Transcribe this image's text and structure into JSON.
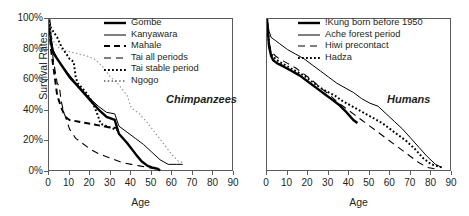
{
  "figure": {
    "axis_label_x": "Age",
    "axis_label_y": "Survival Rates",
    "panels": [
      {
        "id": "chimpanzees",
        "title": "Chimpanzees"
      },
      {
        "id": "humans",
        "title": "Humans"
      }
    ]
  },
  "chart_data": [
    {
      "type": "line",
      "title": "Chimpanzees",
      "xlabel": "Age",
      "ylabel": "Survival Rates",
      "xlim": [
        0,
        90
      ],
      "ylim": [
        0,
        100
      ],
      "xticks": [
        0,
        10,
        20,
        30,
        40,
        50,
        60,
        70,
        80,
        90
      ],
      "yticks": [
        0,
        20,
        40,
        60,
        80,
        100
      ],
      "ytick_labels": [
        "0%",
        "20%",
        "40%",
        "60%",
        "80%",
        "100%"
      ],
      "grid": false,
      "legend_position": "top-right",
      "series": [
        {
          "name": "Gombe",
          "style": "solid-thick",
          "color": "#000000",
          "x": [
            0,
            1,
            2,
            3,
            5,
            8,
            10,
            14,
            18,
            20,
            24,
            28,
            30,
            32,
            34,
            38,
            42,
            45,
            48,
            50,
            53,
            54
          ],
          "y": [
            100,
            84,
            78,
            76,
            72,
            66,
            62,
            56,
            50,
            47,
            41,
            36,
            35,
            34,
            25,
            19,
            12,
            7,
            4,
            3,
            2,
            1
          ]
        },
        {
          "name": "Kanyawara",
          "style": "solid-thin",
          "color": "#000000",
          "x": [
            0,
            1,
            2,
            4,
            6,
            9,
            12,
            16,
            20,
            24,
            28,
            32,
            34,
            38,
            42,
            46,
            50,
            54,
            58,
            62,
            65
          ],
          "y": [
            100,
            88,
            80,
            74,
            70,
            65,
            60,
            54,
            48,
            43,
            39,
            38,
            30,
            26,
            22,
            18,
            13,
            8,
            5,
            5,
            5
          ]
        },
        {
          "name": "Mahale",
          "style": "dashed-thick",
          "color": "#000000",
          "x": [
            0,
            1,
            2,
            3,
            4,
            6,
            8,
            10,
            14,
            18,
            22,
            26,
            30,
            33
          ],
          "y": [
            100,
            80,
            70,
            60,
            50,
            42,
            36,
            34,
            33,
            32,
            31,
            30,
            29,
            29
          ]
        },
        {
          "name": "Tai all periods",
          "style": "dashed-thin",
          "color": "#000000",
          "x": [
            0,
            1,
            2,
            3,
            4,
            5,
            6,
            7,
            8,
            10,
            13,
            16,
            20,
            24,
            28,
            32,
            36,
            40,
            44,
            48,
            52,
            54
          ],
          "y": [
            100,
            88,
            74,
            66,
            58,
            56,
            46,
            40,
            36,
            28,
            22,
            19,
            15,
            12,
            10,
            8,
            6,
            5,
            4,
            3,
            2,
            2
          ]
        },
        {
          "name": "Tai stable period",
          "style": "dotted-thick",
          "color": "#000000",
          "x": [
            0,
            1,
            2,
            4,
            6,
            8,
            10,
            12,
            13,
            14,
            16,
            18,
            20,
            22,
            24,
            25,
            26,
            28,
            30,
            32,
            34
          ],
          "y": [
            100,
            94,
            92,
            88,
            82,
            78,
            74,
            72,
            62,
            58,
            55,
            52,
            48,
            43,
            36,
            32,
            31,
            30,
            29,
            28,
            27
          ]
        },
        {
          "name": "Ngogo",
          "style": "dotted-thin",
          "color": "#8d8d8d",
          "x": [
            0,
            1,
            2,
            4,
            6,
            9,
            12,
            15,
            18,
            22,
            26,
            30,
            34,
            38,
            40,
            44,
            48,
            52,
            56,
            60,
            63,
            66
          ],
          "y": [
            100,
            90,
            86,
            82,
            80,
            79,
            78,
            77,
            76,
            74,
            69,
            62,
            57,
            50,
            42,
            38,
            32,
            25,
            18,
            11,
            7,
            6
          ]
        }
      ]
    },
    {
      "type": "line",
      "title": "Humans",
      "xlabel": "Age",
      "ylabel": "Survival Rates",
      "xlim": [
        0,
        90
      ],
      "ylim": [
        0,
        100
      ],
      "xticks": [
        0,
        10,
        20,
        30,
        40,
        50,
        60,
        70,
        80,
        90
      ],
      "yticks": [
        0,
        20,
        40,
        60,
        80,
        100
      ],
      "grid": false,
      "legend_position": "top-right",
      "series": [
        {
          "name": "!Kung born before 1950",
          "style": "solid-thick",
          "color": "#000000",
          "x": [
            0,
            1,
            2,
            3,
            5,
            8,
            12,
            16,
            20,
            24,
            28,
            32,
            35,
            38,
            40,
            42,
            44
          ],
          "y": [
            100,
            82,
            76,
            73,
            71,
            69,
            66,
            63,
            59,
            55,
            51,
            47,
            44,
            40,
            37,
            34,
            32
          ]
        },
        {
          "name": "Ache forest period",
          "style": "solid-thin",
          "color": "#000000",
          "x": [
            0,
            1,
            2,
            4,
            6,
            10,
            14,
            18,
            22,
            26,
            30,
            34,
            38,
            42,
            46,
            50,
            54,
            58,
            62,
            66,
            70,
            74,
            78,
            82,
            85
          ],
          "y": [
            100,
            92,
            88,
            86,
            84,
            80,
            77,
            74,
            70,
            66,
            62,
            58,
            55,
            52,
            48,
            45,
            43,
            38,
            33,
            28,
            22,
            16,
            10,
            5,
            3
          ]
        },
        {
          "name": "Hiwi precontact",
          "style": "dashed-thin",
          "color": "#000000",
          "x": [
            0,
            1,
            2,
            4,
            6,
            10,
            14,
            18,
            22,
            26,
            30,
            34,
            38,
            42,
            46,
            50,
            54,
            58,
            62,
            66,
            70,
            74,
            78,
            82
          ],
          "y": [
            100,
            85,
            79,
            76,
            74,
            71,
            68,
            64,
            60,
            55,
            51,
            46,
            42,
            38,
            34,
            30,
            26,
            22,
            18,
            14,
            10,
            6,
            3,
            2
          ]
        },
        {
          "name": "Hadza",
          "style": "dotted-thick",
          "color": "#000000",
          "x": [
            0,
            1,
            2,
            4,
            6,
            10,
            14,
            18,
            22,
            26,
            30,
            33,
            36,
            40,
            44,
            48,
            52,
            56,
            60,
            64,
            68,
            72,
            76,
            80,
            85
          ],
          "y": [
            100,
            82,
            77,
            74,
            72,
            69,
            66,
            63,
            59,
            55,
            52,
            50,
            47,
            44,
            41,
            38,
            35,
            32,
            28,
            24,
            20,
            15,
            9,
            5,
            3
          ]
        }
      ]
    }
  ],
  "left_panel": {
    "ytick_labels": [
      "100%",
      "80%",
      "60%",
      "40%",
      "20%",
      "0%"
    ],
    "xtick_labels": [
      "0",
      "10",
      "20",
      "30",
      "40",
      "50",
      "60",
      "70",
      "80",
      "90"
    ],
    "xlabel": "Age",
    "ylabel": "Survival Rates",
    "title": "Chimpanzees",
    "legend": [
      {
        "label": "Gombe",
        "style": "solid-thick"
      },
      {
        "label": "Kanyawara",
        "style": "solid-thin"
      },
      {
        "label": "Mahale",
        "style": "dashed-thick"
      },
      {
        "label": "Tai all periods",
        "style": "dashed-thin"
      },
      {
        "label": "Tai stable period",
        "style": "dotted-thick"
      },
      {
        "label": "Ngogo",
        "style": "dotted-thin"
      }
    ]
  },
  "right_panel": {
    "xtick_labels": [
      "0",
      "10",
      "20",
      "30",
      "40",
      "50",
      "60",
      "70",
      "80",
      "90"
    ],
    "xlabel": "Age",
    "title": "Humans",
    "legend": [
      {
        "label": "!Kung born before 1950",
        "style": "solid-thick"
      },
      {
        "label": "Ache forest period",
        "style": "solid-thin"
      },
      {
        "label": "Hiwi precontact",
        "style": "dashed-thin"
      },
      {
        "label": "Hadza",
        "style": "dotted-thick"
      }
    ]
  }
}
